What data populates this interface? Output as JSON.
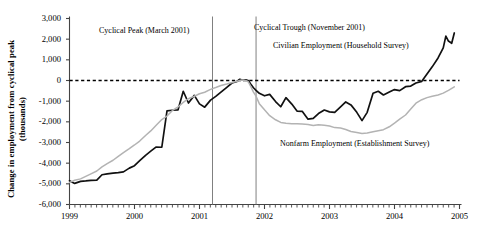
{
  "chart_data": {
    "type": "line",
    "title": "",
    "xlabel": "",
    "ylabel_line1": "Change in employment from cyclical peak",
    "ylabel_line2": "(thousands)",
    "xlim": [
      1999.0,
      2005.0
    ],
    "ylim": [
      -6000,
      3000
    ],
    "grid": false,
    "legend_position": "inline-annotations",
    "y_ticks": [
      3000,
      2000,
      1000,
      0,
      -1000,
      -2000,
      -3000,
      -4000,
      -5000,
      -6000
    ],
    "y_tick_labels": [
      "3,000",
      "2,000",
      "1,000",
      "0",
      "-1,000",
      "-2,000",
      "-3,000",
      "-4,000",
      "-5,000",
      "-6,000"
    ],
    "x_ticks": [
      1999,
      2000,
      2001,
      2002,
      2003,
      2004,
      2005
    ],
    "x_tick_labels": [
      "1999",
      "2000",
      "2001",
      "2002",
      "2003",
      "2004",
      "2005"
    ],
    "x_minor_tick_interval_months": 1,
    "zero_reference_line": {
      "value": 0,
      "style": "dashed",
      "color": "#000000"
    },
    "vertical_markers": [
      {
        "label": "Cyclical Peak (March 2001)",
        "x": 2001.2,
        "color": "#808080"
      },
      {
        "label": "Cyclical Trough (November 2001)",
        "x": 2001.87,
        "color": "#808080"
      }
    ],
    "annotations": [
      {
        "text": "Cyclical Peak (March 2001)",
        "x_px": 99,
        "y_px": 26
      },
      {
        "text": "Cyclical Trough (November 2001)",
        "x_px": 254,
        "y_px": 23
      },
      {
        "text": "Civilian Employment (Household Survey)",
        "x_px": 273,
        "y_px": 41
      },
      {
        "text": "Nonfarm  Employment (Establishment Survey)",
        "x_px": 280,
        "y_px": 139
      }
    ],
    "series": [
      {
        "name": "Civilian Employment (Household Survey)",
        "color": "#111111",
        "width": 1.7,
        "points": [
          [
            1999.0,
            -4850
          ],
          [
            1999.08,
            -4980
          ],
          [
            1999.17,
            -4880
          ],
          [
            1999.25,
            -4860
          ],
          [
            1999.33,
            -4830
          ],
          [
            1999.42,
            -4820
          ],
          [
            1999.5,
            -4560
          ],
          [
            1999.58,
            -4520
          ],
          [
            1999.67,
            -4480
          ],
          [
            1999.75,
            -4460
          ],
          [
            1999.83,
            -4420
          ],
          [
            1999.92,
            -4240
          ],
          [
            2000.0,
            -4120
          ],
          [
            2000.08,
            -3880
          ],
          [
            2000.17,
            -3620
          ],
          [
            2000.25,
            -3420
          ],
          [
            2000.33,
            -3220
          ],
          [
            2000.42,
            -3230
          ],
          [
            2000.5,
            -1470
          ],
          [
            2000.58,
            -1440
          ],
          [
            2000.67,
            -1420
          ],
          [
            2000.75,
            -520
          ],
          [
            2000.83,
            -1090
          ],
          [
            2000.92,
            -720
          ],
          [
            2001.0,
            -1130
          ],
          [
            2001.08,
            -1290
          ],
          [
            2001.17,
            -950
          ],
          [
            2001.25,
            -770
          ],
          [
            2001.33,
            -560
          ],
          [
            2001.42,
            -330
          ],
          [
            2001.5,
            -120
          ],
          [
            2001.58,
            -40
          ],
          [
            2001.62,
            60
          ],
          [
            2001.67,
            10
          ],
          [
            2001.71,
            30
          ],
          [
            2001.75,
            0
          ],
          [
            2001.79,
            -180
          ],
          [
            2001.83,
            -350
          ],
          [
            2001.87,
            -480
          ],
          [
            2001.92,
            -620
          ],
          [
            2002.0,
            -740
          ],
          [
            2002.08,
            -670
          ],
          [
            2002.17,
            -1020
          ],
          [
            2002.25,
            -1270
          ],
          [
            2002.33,
            -830
          ],
          [
            2002.42,
            -1140
          ],
          [
            2002.5,
            -1480
          ],
          [
            2002.58,
            -1490
          ],
          [
            2002.67,
            -1870
          ],
          [
            2002.75,
            -1830
          ],
          [
            2002.83,
            -1600
          ],
          [
            2002.92,
            -1430
          ],
          [
            2003.0,
            -1520
          ],
          [
            2003.08,
            -1540
          ],
          [
            2003.17,
            -1280
          ],
          [
            2003.25,
            -1040
          ],
          [
            2003.33,
            -1180
          ],
          [
            2003.42,
            -1540
          ],
          [
            2003.5,
            -1940
          ],
          [
            2003.58,
            -1540
          ],
          [
            2003.67,
            -620
          ],
          [
            2003.75,
            -520
          ],
          [
            2003.83,
            -700
          ],
          [
            2003.92,
            -560
          ],
          [
            2004.0,
            -440
          ],
          [
            2004.08,
            -490
          ],
          [
            2004.17,
            -300
          ],
          [
            2004.25,
            -270
          ],
          [
            2004.33,
            -120
          ],
          [
            2004.42,
            -40
          ],
          [
            2004.5,
            310
          ],
          [
            2004.58,
            660
          ],
          [
            2004.67,
            1090
          ],
          [
            2004.75,
            1580
          ],
          [
            2004.79,
            2150
          ],
          [
            2004.83,
            1910
          ],
          [
            2004.88,
            1800
          ],
          [
            2004.92,
            2300
          ]
        ]
      },
      {
        "name": "Nonfarm Employment (Establishment Survey)",
        "color": "#b3b3b3",
        "width": 1.5,
        "points": [
          [
            1999.0,
            -4930
          ],
          [
            1999.08,
            -4830
          ],
          [
            1999.17,
            -4760
          ],
          [
            1999.25,
            -4640
          ],
          [
            1999.33,
            -4520
          ],
          [
            1999.42,
            -4380
          ],
          [
            1999.5,
            -4180
          ],
          [
            1999.58,
            -4020
          ],
          [
            1999.67,
            -3860
          ],
          [
            1999.75,
            -3670
          ],
          [
            1999.83,
            -3490
          ],
          [
            1999.92,
            -3300
          ],
          [
            2000.0,
            -3120
          ],
          [
            2000.08,
            -2930
          ],
          [
            2000.17,
            -2660
          ],
          [
            2000.25,
            -2440
          ],
          [
            2000.33,
            -2180
          ],
          [
            2000.42,
            -1890
          ],
          [
            2000.5,
            -1720
          ],
          [
            2000.58,
            -1460
          ],
          [
            2000.67,
            -1280
          ],
          [
            2000.75,
            -1060
          ],
          [
            2000.83,
            -880
          ],
          [
            2000.92,
            -760
          ],
          [
            2001.0,
            -640
          ],
          [
            2001.08,
            -570
          ],
          [
            2001.17,
            -430
          ],
          [
            2001.25,
            -340
          ],
          [
            2001.33,
            -240
          ],
          [
            2001.42,
            -170
          ],
          [
            2001.5,
            -100
          ],
          [
            2001.58,
            -40
          ],
          [
            2001.65,
            20
          ],
          [
            2001.71,
            0
          ],
          [
            2001.75,
            -60
          ],
          [
            2001.79,
            -300
          ],
          [
            2001.83,
            -560
          ],
          [
            2001.87,
            -760
          ],
          [
            2001.92,
            -1120
          ],
          [
            2002.0,
            -1420
          ],
          [
            2002.08,
            -1700
          ],
          [
            2002.17,
            -1900
          ],
          [
            2002.25,
            -2030
          ],
          [
            2002.33,
            -2070
          ],
          [
            2002.42,
            -2090
          ],
          [
            2002.5,
            -2090
          ],
          [
            2002.58,
            -2110
          ],
          [
            2002.67,
            -2130
          ],
          [
            2002.75,
            -2180
          ],
          [
            2002.83,
            -2140
          ],
          [
            2002.92,
            -2170
          ],
          [
            2003.0,
            -2200
          ],
          [
            2003.08,
            -2280
          ],
          [
            2003.17,
            -2300
          ],
          [
            2003.25,
            -2370
          ],
          [
            2003.33,
            -2470
          ],
          [
            2003.42,
            -2520
          ],
          [
            2003.5,
            -2560
          ],
          [
            2003.58,
            -2540
          ],
          [
            2003.67,
            -2480
          ],
          [
            2003.75,
            -2430
          ],
          [
            2003.83,
            -2380
          ],
          [
            2003.92,
            -2240
          ],
          [
            2004.0,
            -2060
          ],
          [
            2004.08,
            -1870
          ],
          [
            2004.17,
            -1670
          ],
          [
            2004.25,
            -1380
          ],
          [
            2004.33,
            -1100
          ],
          [
            2004.42,
            -930
          ],
          [
            2004.5,
            -830
          ],
          [
            2004.58,
            -760
          ],
          [
            2004.67,
            -700
          ],
          [
            2004.75,
            -610
          ],
          [
            2004.83,
            -480
          ],
          [
            2004.92,
            -310
          ]
        ]
      }
    ]
  }
}
